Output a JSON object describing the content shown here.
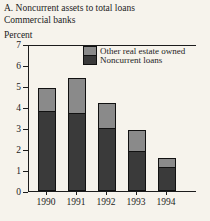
{
  "panel": {
    "title_line1": "A. Noncurrent assets to total loans",
    "title_line2": "Commercial banks",
    "axis_unit_label": "Percent"
  },
  "legend": [
    {
      "label": "Other real estate owned",
      "color": "#8a8a8a"
    },
    {
      "label": "Noncurrent loans",
      "color": "#3a3a3a"
    }
  ],
  "colors": {
    "background": "#f6f3ec",
    "axis": "#1c1c1c",
    "bar_dark": "#3a3a3a",
    "bar_light": "#8a8a8a"
  },
  "chart_data": {
    "type": "bar",
    "stacked": true,
    "ylabel": "Percent",
    "xlabel": "",
    "ylim": [
      0,
      7
    ],
    "yticks": [
      0,
      1,
      2,
      3,
      4,
      5,
      6,
      7
    ],
    "grid": false,
    "legend_position": "top-right-inside",
    "categories": [
      "1990",
      "1991",
      "1992",
      "1993",
      "1994"
    ],
    "series": [
      {
        "name": "Noncurrent loans",
        "color": "#3a3a3a",
        "values": [
          3.8,
          3.7,
          3.0,
          1.9,
          1.1
        ]
      },
      {
        "name": "Other real estate owned",
        "color": "#8a8a8a",
        "values": [
          1.1,
          1.7,
          1.2,
          1.0,
          0.45
        ]
      }
    ],
    "totals": [
      4.9,
      5.4,
      4.2,
      2.9,
      1.55
    ]
  }
}
